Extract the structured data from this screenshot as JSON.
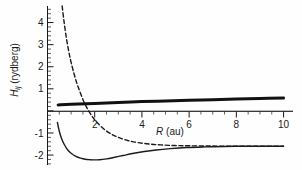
{
  "chart_data": {
    "type": "line",
    "title": "",
    "xlabel": "R (au)",
    "ylabel": "H_ij (rydberg)",
    "ylabel_symbol": "H",
    "ylabel_subscript": "ij",
    "ylabel_units": "(rydberg)",
    "xlabel_symbol": "R",
    "xlabel_units": "(au)",
    "xlim": [
      0,
      10.4
    ],
    "ylim": [
      -2.45,
      4.75
    ],
    "xticks": [
      2,
      4,
      6,
      8,
      10
    ],
    "xtick_labels": [
      "2",
      "4",
      "6",
      "8",
      "10"
    ],
    "xminor_step": 0.5,
    "yticks": [
      4,
      3,
      2,
      1,
      0,
      -1,
      -2
    ],
    "ytick_labels": [
      "4",
      "3",
      "2",
      "1",
      "",
      "-1",
      "-2"
    ],
    "yminor_step": 0.2,
    "grid": false,
    "legend": "none",
    "zero_line": true,
    "series": [
      {
        "name": "coupling-thick-line",
        "style": "solid-thick",
        "color": "#111111",
        "linewidth": 3.0,
        "x": [
          0.45,
          1.0,
          2.0,
          3.0,
          4.0,
          5.0,
          6.0,
          7.0,
          8.0,
          9.0,
          10.0
        ],
        "y": [
          0.27,
          0.3,
          0.34,
          0.38,
          0.42,
          0.45,
          0.48,
          0.51,
          0.54,
          0.56,
          0.58
        ]
      },
      {
        "name": "repulsive-dashed-curve",
        "style": "dashed",
        "color": "#1a1a1a",
        "linewidth": 1.4,
        "x": [
          0.62,
          0.7,
          0.8,
          0.9,
          1.0,
          1.15,
          1.3,
          1.5,
          1.7,
          1.9,
          2.1,
          2.4,
          2.7,
          3.0,
          3.4,
          3.8,
          4.3,
          4.8,
          5.4,
          6.0,
          6.8,
          7.6,
          8.4,
          9.2,
          10.0
        ],
        "y": [
          4.75,
          4.05,
          3.3,
          2.7,
          2.2,
          1.58,
          1.08,
          0.52,
          0.08,
          -0.26,
          -0.53,
          -0.83,
          -1.05,
          -1.2,
          -1.34,
          -1.43,
          -1.5,
          -1.54,
          -1.57,
          -1.58,
          -1.59,
          -1.6,
          -1.6,
          -1.6,
          -1.6
        ]
      },
      {
        "name": "bound-solid-curve",
        "style": "solid",
        "color": "#1a1a1a",
        "linewidth": 1.4,
        "x": [
          0.42,
          0.5,
          0.6,
          0.7,
          0.85,
          1.0,
          1.2,
          1.4,
          1.6,
          1.8,
          2.0,
          2.2,
          2.5,
          2.8,
          3.2,
          3.6,
          4.1,
          4.6,
          5.2,
          5.9,
          6.7,
          7.5,
          8.4,
          9.2,
          10.0
        ],
        "y": [
          -0.52,
          -0.92,
          -1.26,
          -1.5,
          -1.76,
          -1.92,
          -2.06,
          -2.14,
          -2.19,
          -2.21,
          -2.22,
          -2.21,
          -2.17,
          -2.11,
          -2.02,
          -1.93,
          -1.84,
          -1.77,
          -1.71,
          -1.66,
          -1.63,
          -1.61,
          -1.6,
          -1.6,
          -1.6
        ]
      }
    ],
    "annotations": []
  }
}
